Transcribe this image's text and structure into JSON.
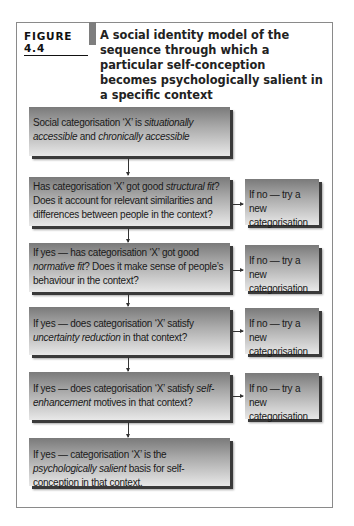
{
  "figure": {
    "label": "FIGURE 4.4",
    "title": "A social identity model of the sequence through which a particular self-conception becomes psychologically salient in a specific context"
  },
  "flow": {
    "steps": [
      {
        "id": "step1",
        "parts": [
          {
            "t": "Social categorisation ‘X’ is ",
            "i": false
          },
          {
            "t": "situationally accessible",
            "i": true
          },
          {
            "t": " and ",
            "i": false
          },
          {
            "t": "chronically accessible",
            "i": true
          }
        ],
        "plain": "Social categorisation 'X' is situationally accessible and chronically accessible"
      },
      {
        "id": "step2",
        "parts": [
          {
            "t": "Has categorisation ‘X’ got good ",
            "i": false
          },
          {
            "t": "structural fit",
            "i": true
          },
          {
            "t": "? Does it account for relevant similarities and differences between people in the context?",
            "i": false
          }
        ],
        "plain": "Has categorisation 'X' got good structural fit? Does it account for relevant similarities and differences between people in the context?",
        "no_branch": "If no — try a new categorisation"
      },
      {
        "id": "step3",
        "parts": [
          {
            "t": "If yes — has categorisation ‘X’ got good ",
            "i": false
          },
          {
            "t": "normative fit",
            "i": true
          },
          {
            "t": "? Does it make sense of people’s behaviour in the context?",
            "i": false
          }
        ],
        "plain": "If yes — has categorisation 'X' got good normative fit? Does it make sense of people's behaviour in the context?",
        "no_branch": "If no — try a new categorisation"
      },
      {
        "id": "step4",
        "parts": [
          {
            "t": "If yes — does categorisation ‘X’ satisfy ",
            "i": false
          },
          {
            "t": "uncertainty reduction",
            "i": true
          },
          {
            "t": " in that context?",
            "i": false
          }
        ],
        "plain": "If yes — does categorisation 'X' satisfy uncertainty reduction in that context?",
        "no_branch": "If no — try a new categorisation"
      },
      {
        "id": "step5",
        "parts": [
          {
            "t": "If yes — does categorisation ‘X’ satisfy ",
            "i": false
          },
          {
            "t": "self-enhancement",
            "i": true
          },
          {
            "t": " motives in that context?",
            "i": false
          }
        ],
        "plain": "If yes — does categorisation 'X' satisfy self-enhancement motives in that context?",
        "no_branch": "If no — try a new categorisation"
      },
      {
        "id": "step6",
        "parts": [
          {
            "t": "If yes — categorisation ‘X’ is the ",
            "i": false
          },
          {
            "t": "psychologically salient",
            "i": true
          },
          {
            "t": " basis for self-conception in that context.",
            "i": false
          }
        ],
        "plain": "If yes — categorisation 'X' is the psychologically salient basis for self-conception in that context."
      }
    ]
  }
}
